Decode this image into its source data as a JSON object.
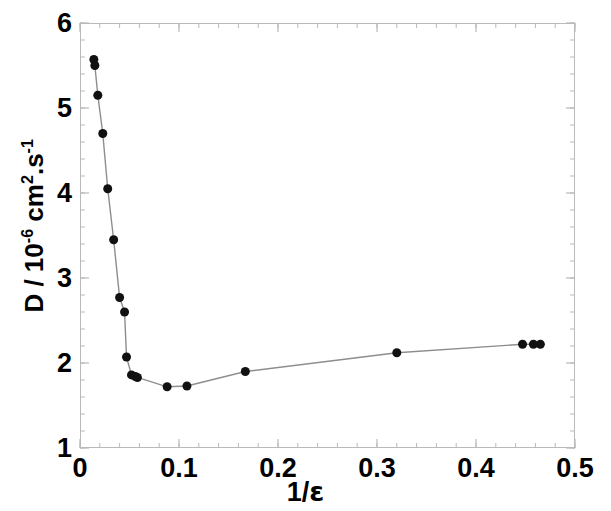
{
  "chart_data": {
    "type": "scatter",
    "title": "",
    "xlabel": "1/ε",
    "ylabel": "D / 10-6 cm2.s-1",
    "ylabel_parts": {
      "lead": "D / 10",
      "exp1": "-6",
      "mid": " cm",
      "exp2": "2",
      "tail": ".s",
      "exp3": "-1"
    },
    "xlabel_parts": {
      "numerator": "1/",
      "symbol": "ε"
    },
    "xlim": [
      0,
      0.5
    ],
    "ylim": [
      1,
      6
    ],
    "xticks": [
      0,
      0.1,
      0.2,
      0.3,
      0.4,
      0.5
    ],
    "xtick_labels": [
      "0",
      "0.1",
      "0.2",
      "0.3",
      "0.4",
      "0.5"
    ],
    "yticks": [
      1,
      2,
      3,
      4,
      5,
      6
    ],
    "ytick_labels": [
      "1",
      "2",
      "3",
      "4",
      "5",
      "6"
    ],
    "minor_ticks": true,
    "grid": false,
    "legend": null,
    "marker": "filled-circle",
    "marker_color": "#111111",
    "marker_size": 9,
    "line_color": "#8d8d8d",
    "line_width": 1.4,
    "axis_color": "#b9b9b9",
    "x": [
      0.014,
      0.015,
      0.018,
      0.023,
      0.028,
      0.034,
      0.04,
      0.045,
      0.047,
      0.052,
      0.056,
      0.058,
      0.088,
      0.108,
      0.167,
      0.32,
      0.447,
      0.458,
      0.465
    ],
    "y": [
      5.57,
      5.5,
      5.15,
      4.7,
      4.05,
      3.45,
      2.77,
      2.6,
      2.07,
      1.86,
      1.84,
      1.83,
      1.72,
      1.73,
      1.9,
      2.12,
      2.22,
      2.22,
      2.22
    ],
    "points": [
      {
        "x": 0.014,
        "y": 5.57
      },
      {
        "x": 0.015,
        "y": 5.5
      },
      {
        "x": 0.018,
        "y": 5.15
      },
      {
        "x": 0.023,
        "y": 4.7
      },
      {
        "x": 0.028,
        "y": 4.05
      },
      {
        "x": 0.034,
        "y": 3.45
      },
      {
        "x": 0.04,
        "y": 2.77
      },
      {
        "x": 0.045,
        "y": 2.6
      },
      {
        "x": 0.047,
        "y": 2.07
      },
      {
        "x": 0.052,
        "y": 1.86
      },
      {
        "x": 0.056,
        "y": 1.84
      },
      {
        "x": 0.058,
        "y": 1.83
      },
      {
        "x": 0.088,
        "y": 1.72
      },
      {
        "x": 0.108,
        "y": 1.73
      },
      {
        "x": 0.167,
        "y": 1.9
      },
      {
        "x": 0.32,
        "y": 2.12
      },
      {
        "x": 0.447,
        "y": 2.22
      },
      {
        "x": 0.458,
        "y": 2.22
      },
      {
        "x": 0.465,
        "y": 2.22
      }
    ]
  }
}
